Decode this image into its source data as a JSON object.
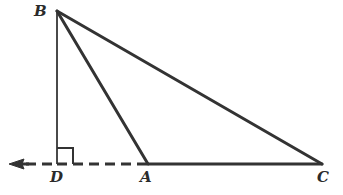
{
  "figure": {
    "name": "right-triangle-with-extended-base",
    "background_color": "#ffffff",
    "stroke_color": "#333333",
    "thin_stroke_color": "#4a4a4a",
    "width": 343,
    "height": 195
  },
  "labels": {
    "b": "B",
    "a": "A",
    "c": "C",
    "d": "D"
  },
  "points": {
    "B": {
      "x": 57,
      "y": 11
    },
    "D": {
      "x": 57,
      "y": 164
    },
    "A": {
      "x": 148,
      "y": 164
    },
    "C": {
      "x": 322,
      "y": 164
    }
  },
  "label_positions": {
    "B": {
      "x": 34,
      "y": 6
    },
    "D": {
      "x": 50,
      "y": 170
    },
    "A": {
      "x": 140,
      "y": 170
    },
    "C": {
      "x": 318,
      "y": 170
    }
  },
  "segments": {
    "altitude_BD": {
      "from": "B",
      "to": "D",
      "style": "solid",
      "width": 2
    },
    "side_BA": {
      "from": "B",
      "to": "A",
      "style": "solid",
      "width": 3
    },
    "side_BC": {
      "from": "B",
      "to": "C",
      "style": "solid",
      "width": 3
    },
    "base_AC": {
      "from": "A",
      "to": "C",
      "style": "solid",
      "width": 3
    },
    "extension_DA": {
      "from": "D",
      "to": "A",
      "style": "dashed",
      "width": 3,
      "dash_pattern": "10 6"
    },
    "ray_left_of_D": {
      "from": "D",
      "to": {
        "x": 24,
        "y": 164
      },
      "style": "dashed",
      "width": 3,
      "dash_pattern": "10 6"
    }
  },
  "markers": {
    "right_angle": {
      "at": "D",
      "size": 16,
      "opens_toward": "A",
      "stroke_width": 2
    },
    "arrow": {
      "direction": "left",
      "tip": {
        "x": 9,
        "y": 164
      },
      "tail": {
        "x": 28,
        "y": 164
      },
      "head_length": 13,
      "head_halfwidth": 5
    }
  }
}
